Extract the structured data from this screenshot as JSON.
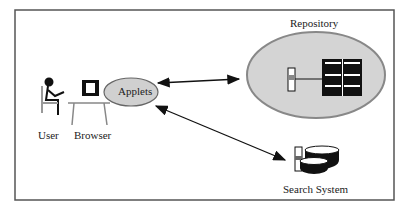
{
  "diagram": {
    "nodes": {
      "user": {
        "label": "User",
        "icon": "person-at-desk-icon"
      },
      "browser": {
        "label": "Browser",
        "icon": "computer-icon"
      },
      "applets": {
        "label": "Applets"
      },
      "repository": {
        "label": "Repository",
        "icon": "server-storage-icon"
      },
      "search": {
        "label": "Search System",
        "icon": "database-server-icon"
      }
    },
    "edges": [
      {
        "from": "applets",
        "to": "repository",
        "type": "bidirectional"
      },
      {
        "from": "applets",
        "to": "search",
        "type": "bidirectional"
      }
    ],
    "colors": {
      "ellipse_fill": "#d0d0d0",
      "ellipse_stroke": "#888888",
      "frame": "#555555"
    }
  }
}
